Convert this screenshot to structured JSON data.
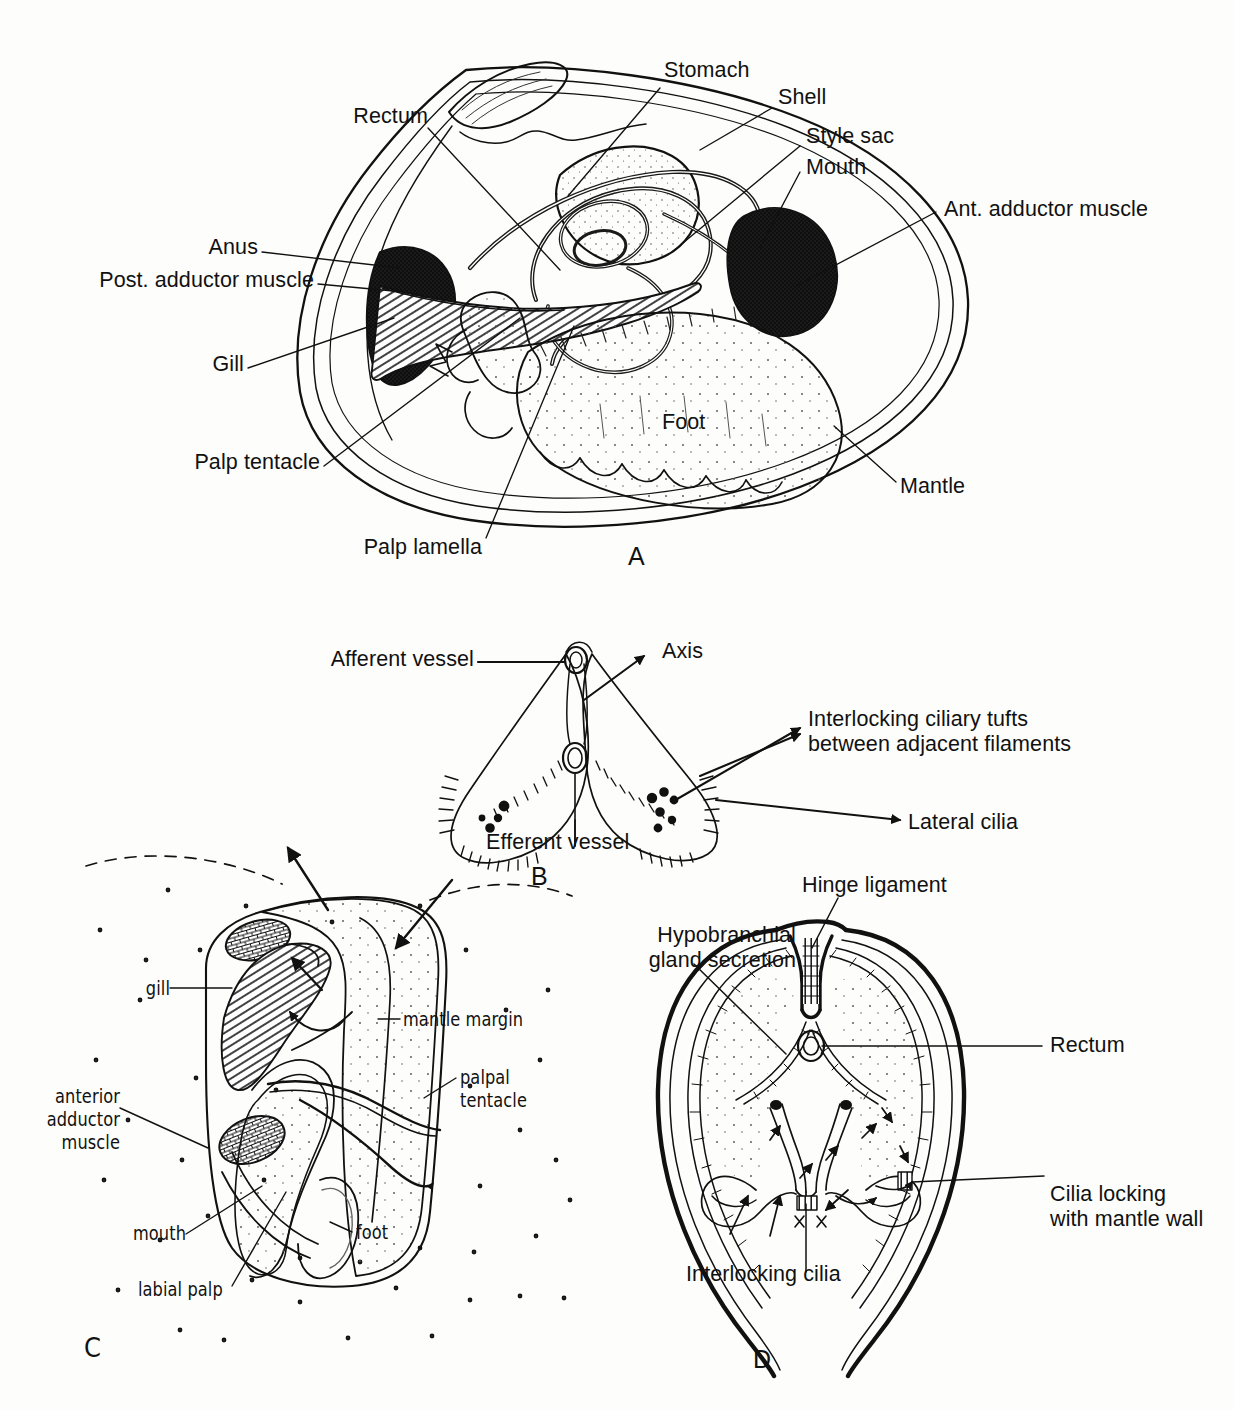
{
  "figure": {
    "background_color": "#fdfdfb",
    "ink_color": "#111111"
  },
  "panels": [
    {
      "id": "A",
      "letter": "A",
      "subject": "Lateral view of bivalve with left shell valve and mantle removed",
      "labels": [
        {
          "name": "rectum",
          "text": "Rectum"
        },
        {
          "name": "stomach",
          "text": "Stomach"
        },
        {
          "name": "shell",
          "text": "Shell"
        },
        {
          "name": "style-sac",
          "text": "Style sac"
        },
        {
          "name": "mouth",
          "text": "Mouth"
        },
        {
          "name": "ant-adductor-muscle",
          "text": "Ant. adductor muscle"
        },
        {
          "name": "anus",
          "text": "Anus"
        },
        {
          "name": "post-adductor-muscle",
          "text": "Post. adductor muscle"
        },
        {
          "name": "gill",
          "text": "Gill"
        },
        {
          "name": "palp-tentacle",
          "text": "Palp tentacle"
        },
        {
          "name": "palp-lamella",
          "text": "Palp lamella"
        },
        {
          "name": "foot",
          "text": "Foot"
        },
        {
          "name": "mantle",
          "text": "Mantle"
        }
      ]
    },
    {
      "id": "B",
      "letter": "B",
      "subject": "Transverse section of a pair of gill filaments",
      "labels": [
        {
          "name": "afferent-vessel",
          "text": "Afferent vessel"
        },
        {
          "name": "axis",
          "text": "Axis"
        },
        {
          "name": "interlocking-ciliary-tufts",
          "text": "Interlocking ciliary tufts\nbetween adjacent filaments"
        },
        {
          "name": "lateral-cilia",
          "text": "Lateral cilia"
        },
        {
          "name": "efferent-vessel",
          "text": "Efferent vessel"
        }
      ]
    },
    {
      "id": "C",
      "letter": "C",
      "subject": "Bivalve with right valve and mantle lobe removed showing water currents",
      "labels": [
        {
          "name": "gill",
          "text": "gill"
        },
        {
          "name": "mantle-margin",
          "text": "mantle margin"
        },
        {
          "name": "palpal-tentacle",
          "text": "palpal\ntentacle"
        },
        {
          "name": "anterior-adductor-muscle",
          "text": "anterior\nadductor\nmuscle"
        },
        {
          "name": "mouth",
          "text": "mouth"
        },
        {
          "name": "foot",
          "text": "foot"
        },
        {
          "name": "labial-palp",
          "text": "labial palp"
        }
      ]
    },
    {
      "id": "D",
      "letter": "D",
      "subject": "Transverse section through the mantle cavity showing ciliary currents",
      "labels": [
        {
          "name": "hinge-ligament",
          "text": "Hinge ligament"
        },
        {
          "name": "hypobranchial-gland-secretion",
          "text": "Hypobranchial\ngland secretion"
        },
        {
          "name": "rectum",
          "text": "Rectum"
        },
        {
          "name": "cilia-locking-with-mantle-wall",
          "text": "Cilia locking\nwith mantle wall"
        },
        {
          "name": "interlocking-cilia",
          "text": "Interlocking cilia"
        },
        {
          "name": "cross-mark-left",
          "text": "x"
        },
        {
          "name": "cross-mark-right",
          "text": "x"
        }
      ]
    }
  ],
  "caption": {
    "text": "",
    "note_visible": false
  }
}
